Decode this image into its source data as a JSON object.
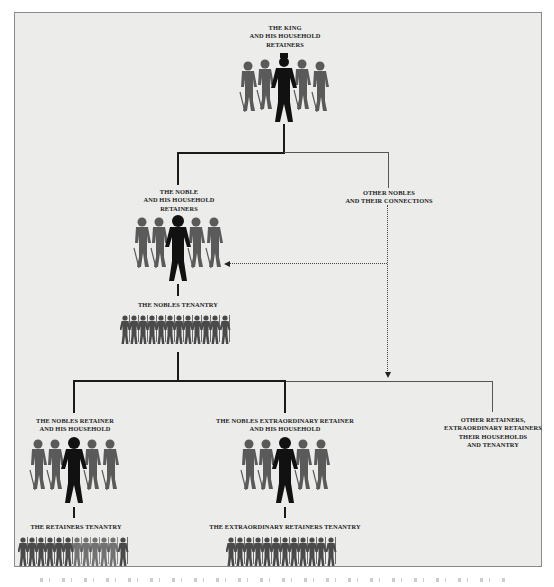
{
  "diagram": {
    "type": "hierarchy",
    "nodes": {
      "king": {
        "label": "THE KING\nAND HIS HOUSEHOLD\nRETAINERS",
        "figure": "crowned-lord-with-five-retainers"
      },
      "noble": {
        "label": "THE NOBLE\nAND HIS HOUSEHOLD\nRETAINERS",
        "figure": "lord-with-five-retainers"
      },
      "other_nobles": {
        "label": "OTHER NOBLES\nAND THEIR CONNECTIONS"
      },
      "nobles_tenantry": {
        "label": "THE NOBLES TENANTRY",
        "figure": "row-of-armed-tenants"
      },
      "nobles_retainer": {
        "label": "THE NOBLES RETAINER\nAND HIS HOUSEHOLD",
        "figure": "lord-with-five-retainers"
      },
      "extraordinary_retainer": {
        "label": "THE NOBLES EXTRAORDINARY RETAINER\nAND HIS HOUSEHOLD",
        "figure": "lord-with-five-retainers"
      },
      "other_retainers": {
        "label": "OTHER RETAINERS,\nEXTRAORDINARY RETAINERS\nTHEIR HOUSEHOLDS\nAND TENANTRY"
      },
      "retainers_tenantry": {
        "label": "THE RETAINERS TENANTRY",
        "figure": "row-of-armed-tenants"
      },
      "extraordinary_tenantry": {
        "label": "THE EXTRAORDINARY RETAINERS TENANTRY",
        "figure": "row-of-armed-tenants"
      }
    },
    "edges": [
      {
        "from": "king",
        "to": "noble",
        "style": "solid-thick"
      },
      {
        "from": "king",
        "to": "other_nobles",
        "style": "solid-thin"
      },
      {
        "from": "other_nobles",
        "to": "noble",
        "style": "dotted-arrow"
      },
      {
        "from": "other_nobles",
        "to": "retainers-branch",
        "style": "dotted-arrow"
      },
      {
        "from": "noble",
        "to": "nobles_tenantry",
        "style": "solid-thick"
      },
      {
        "from": "nobles_tenantry",
        "to": "nobles_retainer",
        "style": "solid-thick"
      },
      {
        "from": "nobles_tenantry",
        "to": "extraordinary_retainer",
        "style": "solid-thick"
      },
      {
        "from": "nobles_tenantry",
        "to": "other_retainers",
        "style": "solid-thin"
      },
      {
        "from": "nobles_retainer",
        "to": "retainers_tenantry",
        "style": "solid-thick"
      },
      {
        "from": "extraordinary_retainer",
        "to": "extraordinary_tenantry",
        "style": "solid-thick"
      }
    ],
    "colors": {
      "background": "#ececeb",
      "frame_border": "#8a8a8a",
      "lord_silhouette": "#111111",
      "retainer_silhouette": "#5a5a5a",
      "tenant_silhouette": "#4a4a4a",
      "lines": "#1a1a1a"
    }
  }
}
